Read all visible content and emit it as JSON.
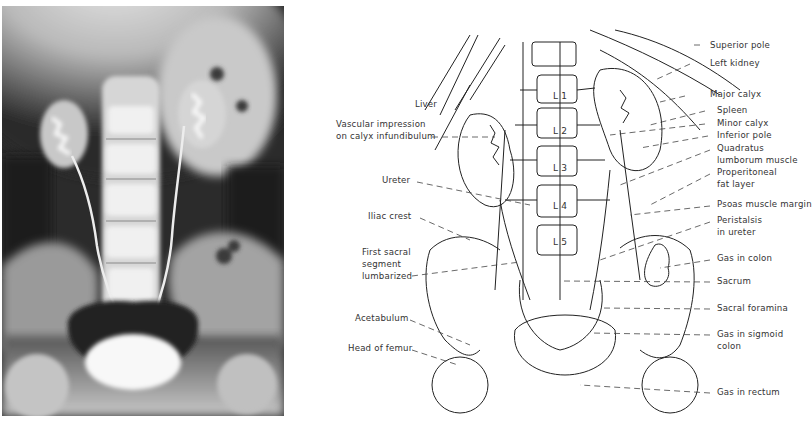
{
  "figure": {
    "xray_panel": {
      "description": "Excretory urogram radiograph (AP abdomen/pelvis) with contrast-filled kidneys, ureters and bladder"
    },
    "diagram_panel": {
      "vertebra_labels": [
        "L 1",
        "L 2",
        "L 3",
        "L 4",
        "L 5"
      ],
      "left_labels": [
        {
          "id": "liver",
          "lines": [
            "Liver"
          ]
        },
        {
          "id": "vascular-impression",
          "lines": [
            "Vascular impression",
            "on calyx infundibulum"
          ]
        },
        {
          "id": "ureter",
          "lines": [
            "Ureter"
          ]
        },
        {
          "id": "iliac-crest",
          "lines": [
            "Iliac crest"
          ]
        },
        {
          "id": "first-sacral",
          "lines": [
            "First sacral",
            "segment",
            "lumbarized"
          ]
        },
        {
          "id": "acetabulum",
          "lines": [
            "Acetabulum"
          ]
        },
        {
          "id": "head-of-femur",
          "lines": [
            "Head of femur"
          ]
        }
      ],
      "right_labels": [
        {
          "id": "superior-pole",
          "lines": [
            "Superior pole"
          ]
        },
        {
          "id": "left-kidney",
          "lines": [
            "Left kidney"
          ]
        },
        {
          "id": "major-calyx",
          "lines": [
            "Major calyx"
          ]
        },
        {
          "id": "spleen",
          "lines": [
            "Spleen"
          ]
        },
        {
          "id": "minor-calyx",
          "lines": [
            "Minor calyx"
          ]
        },
        {
          "id": "inferior-pole",
          "lines": [
            "Inferior pole"
          ]
        },
        {
          "id": "quadratus",
          "lines": [
            "Quadratus",
            "lumborum muscle"
          ]
        },
        {
          "id": "properitoneal",
          "lines": [
            "Properitoneal",
            "fat layer"
          ]
        },
        {
          "id": "psoas",
          "lines": [
            "Psoas muscle margin"
          ]
        },
        {
          "id": "peristalsis",
          "lines": [
            "Peristalsis",
            "in ureter"
          ]
        },
        {
          "id": "gas-colon",
          "lines": [
            "Gas in colon"
          ]
        },
        {
          "id": "sacrum",
          "lines": [
            "Sacrum"
          ]
        },
        {
          "id": "sacral-foramina",
          "lines": [
            "Sacral foramina"
          ]
        },
        {
          "id": "gas-sigmoid",
          "lines": [
            "Gas in sigmoid",
            "colon"
          ]
        },
        {
          "id": "gas-rectum",
          "lines": [
            "Gas in rectum"
          ]
        }
      ]
    }
  }
}
